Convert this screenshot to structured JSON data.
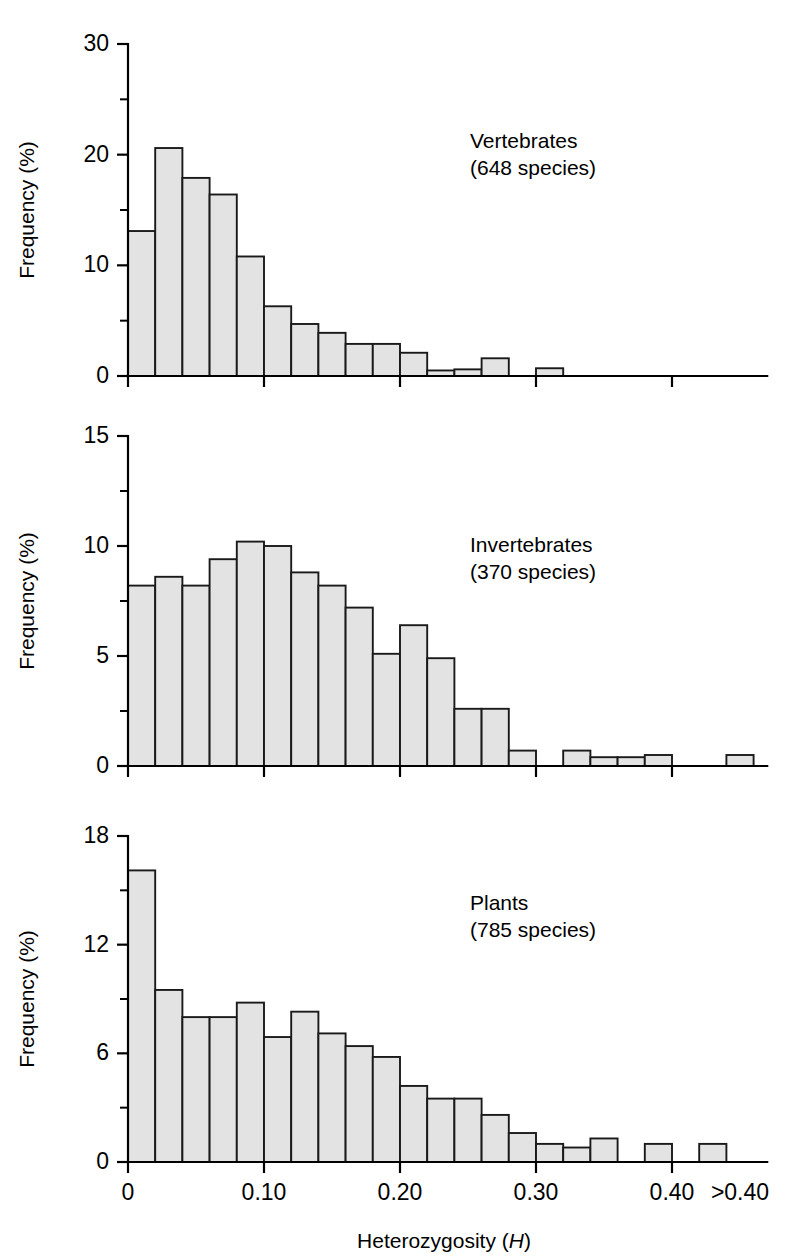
{
  "figure": {
    "background_color": "#ffffff",
    "bar_fill_color": "#e3e3e3",
    "bar_stroke_color": "#1a1a1a",
    "axis_color": "#000000",
    "xlabel_main": "Heterozygosity (",
    "xlabel_italic": "H",
    "xlabel_close": ")",
    "ylabel": "Frequency (%)",
    "xticks": [
      "0",
      "0.10",
      "0.20",
      "0.30",
      "0.40",
      ">0.40"
    ],
    "xtick_values": [
      0,
      0.1,
      0.2,
      0.3,
      0.4,
      0.45
    ]
  },
  "chart_data": [
    {
      "type": "bar",
      "title": "Vertebrates",
      "subtitle": "(648 species)",
      "xlabel": "Heterozygosity (H)",
      "ylabel": "Frequency (%)",
      "ylim": [
        0,
        30
      ],
      "yticks_major": [
        0,
        10,
        20,
        30
      ],
      "yticks_minor": [
        5,
        15,
        25
      ],
      "grid": false,
      "legend": "none",
      "bin_width": 0.02,
      "bin_starts": [
        0.0,
        0.02,
        0.04,
        0.06,
        0.08,
        0.1,
        0.12,
        0.14,
        0.16,
        0.18,
        0.2,
        0.22,
        0.24,
        0.26,
        0.28,
        0.3,
        0.32
      ],
      "categories": [
        "0.00-0.02",
        "0.02-0.04",
        "0.04-0.06",
        "0.06-0.08",
        "0.08-0.10",
        "0.10-0.12",
        "0.12-0.14",
        "0.14-0.16",
        "0.16-0.18",
        "0.18-0.20",
        "0.20-0.22",
        "0.22-0.24",
        "0.24-0.26",
        "0.26-0.28",
        "0.28-0.30",
        "0.30-0.32",
        "0.32-0.34"
      ],
      "values": [
        13.1,
        20.6,
        17.9,
        16.4,
        10.8,
        6.3,
        4.7,
        3.9,
        2.9,
        2.9,
        2.1,
        0.5,
        0.6,
        1.6,
        0.0,
        0.7,
        0.0
      ]
    },
    {
      "type": "bar",
      "title": "Invertebrates",
      "subtitle": "(370 species)",
      "xlabel": "Heterozygosity (H)",
      "ylabel": "Frequency (%)",
      "ylim": [
        0,
        15
      ],
      "yticks_major": [
        0,
        5,
        10,
        15
      ],
      "yticks_minor": [
        2.5,
        7.5,
        12.5
      ],
      "grid": false,
      "legend": "none",
      "bin_width": 0.02,
      "bin_starts": [
        0.0,
        0.02,
        0.04,
        0.06,
        0.08,
        0.1,
        0.12,
        0.14,
        0.16,
        0.18,
        0.2,
        0.22,
        0.24,
        0.26,
        0.28,
        0.3,
        0.32,
        0.34,
        0.36,
        0.38,
        0.4,
        0.42,
        0.44
      ],
      "categories": [
        "0.00-0.02",
        "0.02-0.04",
        "0.04-0.06",
        "0.06-0.08",
        "0.08-0.10",
        "0.10-0.12",
        "0.12-0.14",
        "0.14-0.16",
        "0.16-0.18",
        "0.18-0.20",
        "0.20-0.22",
        "0.22-0.24",
        "0.24-0.26",
        "0.26-0.28",
        "0.28-0.30",
        "0.30-0.32",
        "0.32-0.34",
        "0.34-0.36",
        "0.36-0.38",
        "0.38-0.40",
        "0.40-0.42",
        "0.42-0.44",
        ">0.44"
      ],
      "values": [
        8.2,
        8.6,
        8.2,
        9.4,
        10.2,
        10.0,
        8.8,
        8.2,
        7.2,
        5.1,
        6.4,
        4.9,
        2.6,
        2.6,
        0.7,
        0.0,
        0.7,
        0.4,
        0.4,
        0.5,
        0.0,
        0.0,
        0.5
      ]
    },
    {
      "type": "bar",
      "title": "Plants",
      "subtitle": "(785 species)",
      "xlabel": "Heterozygosity (H)",
      "ylabel": "Frequency (%)",
      "ylim": [
        0,
        18
      ],
      "yticks_major": [
        0,
        6,
        12,
        18
      ],
      "yticks_minor": [
        3,
        9,
        15
      ],
      "grid": false,
      "legend": "none",
      "bin_width": 0.02,
      "bin_starts": [
        0.0,
        0.02,
        0.04,
        0.06,
        0.08,
        0.1,
        0.12,
        0.14,
        0.16,
        0.18,
        0.2,
        0.22,
        0.24,
        0.26,
        0.28,
        0.3,
        0.32,
        0.34,
        0.36,
        0.38,
        0.4,
        0.42,
        0.44
      ],
      "categories": [
        "0.00-0.02",
        "0.02-0.04",
        "0.04-0.06",
        "0.06-0.08",
        "0.08-0.10",
        "0.10-0.12",
        "0.12-0.14",
        "0.14-0.16",
        "0.16-0.18",
        "0.18-0.20",
        "0.20-0.22",
        "0.22-0.24",
        "0.24-0.26",
        "0.26-0.28",
        "0.28-0.30",
        "0.30-0.32",
        "0.32-0.34",
        "0.34-0.36",
        "0.36-0.38",
        "0.38-0.40",
        "0.40-0.42",
        "0.42-0.44",
        ">0.44"
      ],
      "values": [
        16.1,
        9.5,
        8.0,
        8.0,
        8.8,
        6.9,
        8.3,
        7.1,
        6.4,
        5.8,
        4.2,
        3.5,
        3.5,
        2.6,
        1.6,
        1.0,
        0.8,
        1.3,
        0.0,
        1.0,
        0.0,
        1.0,
        0.0
      ]
    }
  ]
}
